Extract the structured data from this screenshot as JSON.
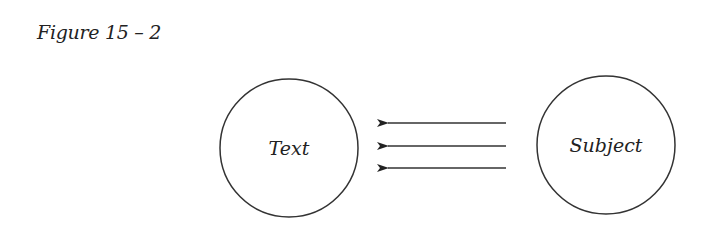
{
  "figure": {
    "caption": "Figure 15 – 2"
  },
  "diagram": {
    "nodes": [
      {
        "id": "text",
        "label": "Text"
      },
      {
        "id": "subject",
        "label": "Subject"
      }
    ],
    "edges": [
      {
        "from": "subject",
        "to": "text"
      },
      {
        "from": "subject",
        "to": "text"
      },
      {
        "from": "subject",
        "to": "text"
      }
    ],
    "colors": {
      "stroke": "#333333",
      "background": "#ffffff"
    }
  }
}
